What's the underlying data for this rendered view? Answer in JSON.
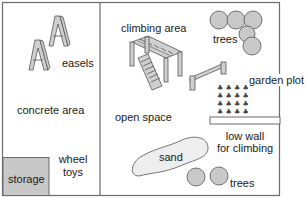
{
  "diagram": {
    "type": "playground floor plan",
    "colors": {
      "outline": "#6b6b6b",
      "storage_fill": "#c8c8c8",
      "tree_fill": "#c9c9c9",
      "sand_fill": "#eeeeee",
      "equipment_fill": "#d0d0d0",
      "text": "#1a1a1a"
    },
    "labels": {
      "easels": "easels",
      "concrete_area": "concrete area",
      "wheel_toys_line1": "wheel",
      "wheel_toys_line2": "toys",
      "storage": "storage",
      "climbing_area": "climbing area",
      "trees_top": "trees",
      "garden_plot": "garden plot",
      "open_space": "open space",
      "low_wall_line1": "low wall",
      "low_wall_line2": "for climbing",
      "sand": "sand",
      "trees_bottom": "trees"
    },
    "icons": [
      "easel-icon",
      "climbing-frame-icon",
      "bench-icon",
      "tree-icon",
      "plant-icon",
      "sandpit-icon",
      "low-wall-icon"
    ]
  }
}
